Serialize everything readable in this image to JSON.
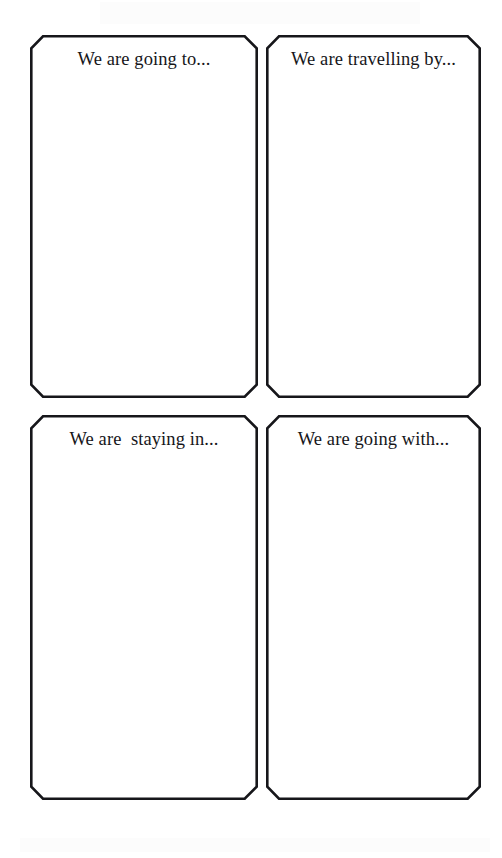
{
  "page": {
    "background_color": "#ffffff",
    "ink_color": "#16161a",
    "width": 502,
    "height": 858
  },
  "style": {
    "border_color": "#16161a",
    "border_width_px": 2.6,
    "corner_chamfer_px": 13,
    "fill_color": "#ffffff"
  },
  "cards": [
    {
      "id": "going-to",
      "label": "We are going to...",
      "row": 1,
      "column": 1
    },
    {
      "id": "travelling-by",
      "label": "We are travelling by...",
      "row": 1,
      "column": 2
    },
    {
      "id": "staying-in",
      "label": "We are  staying in...",
      "row": 2,
      "column": 1
    },
    {
      "id": "going-with",
      "label": "We are going with...",
      "row": 2,
      "column": 2
    }
  ]
}
